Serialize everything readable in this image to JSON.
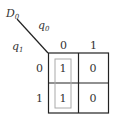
{
  "kmap": {
    "output_var": "D",
    "output_sub": "0",
    "col_var": "q",
    "col_sub": "0",
    "row_var": "q",
    "row_sub": "1",
    "col_labels": [
      "0",
      "1"
    ],
    "row_labels": [
      "0",
      "1"
    ],
    "cells": [
      [
        "1",
        "0"
      ],
      [
        "1",
        "0"
      ]
    ],
    "grouping": {
      "cells": [
        [
          0,
          0
        ],
        [
          1,
          0
        ]
      ],
      "color": "#aaaaaa"
    },
    "line_color": "#222222"
  }
}
